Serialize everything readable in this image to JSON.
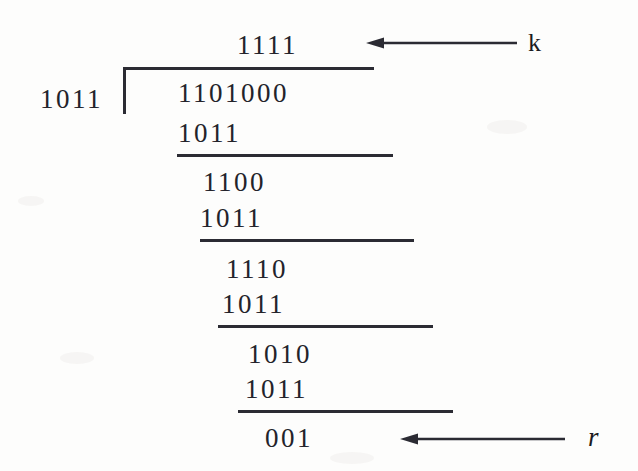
{
  "figure": {
    "background_color": "#fdfdfc",
    "ink_color": "#23232a"
  },
  "division": {
    "quotient": "1111",
    "divisor": "1011",
    "dividend": "1101000",
    "remainder": "001",
    "steps": [
      {
        "subtrahend": "1011",
        "difference": "1100"
      },
      {
        "subtrahend": "1011",
        "difference": "1110"
      },
      {
        "subtrahend": "1011",
        "difference": "1010"
      },
      {
        "subtrahend": "1011",
        "difference": "001"
      }
    ]
  },
  "annotations": {
    "quotient_label": "k",
    "remainder_label": "r"
  },
  "rows": {
    "quotient": "1111",
    "divisor": "1011",
    "dividend": "1101000",
    "sub1": "1011",
    "diff1": "1100",
    "sub2": "1011",
    "diff2": "1110",
    "sub3": "1011",
    "diff3": "1010",
    "sub4": "1011",
    "remainder": "001"
  }
}
